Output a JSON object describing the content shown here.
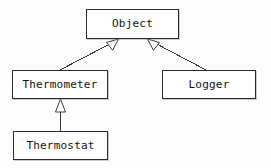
{
  "diagram": {
    "type": "uml-class-diagram",
    "background_color": "#fdfdfd",
    "line_color": "#3a3a3a",
    "box_border_color": "#2b2b2b",
    "box_fill_color": "#ffffff",
    "text_color": "#111111"
  },
  "nodes": {
    "object": {
      "label": "Object",
      "x": 86,
      "y": 9,
      "w": 93,
      "h": 30
    },
    "thermometer": {
      "label": "Thermometer",
      "x": 12,
      "y": 70,
      "w": 96,
      "h": 29
    },
    "logger": {
      "label": "Logger",
      "x": 162,
      "y": 70,
      "w": 94,
      "h": 29
    },
    "thermostat": {
      "label": "Thermostat",
      "x": 13,
      "y": 131,
      "w": 95,
      "h": 29
    }
  },
  "edges": [
    {
      "name": "thermometer-generalizes-object",
      "from": "thermometer",
      "to": "object",
      "kind": "generalization",
      "arrowhead": "hollow-triangle"
    },
    {
      "name": "logger-generalizes-object",
      "from": "logger",
      "to": "object",
      "kind": "generalization",
      "arrowhead": "hollow-triangle"
    },
    {
      "name": "thermostat-generalizes-thermometer",
      "from": "thermostat",
      "to": "thermometer",
      "kind": "generalization",
      "arrowhead": "hollow-triangle"
    }
  ]
}
